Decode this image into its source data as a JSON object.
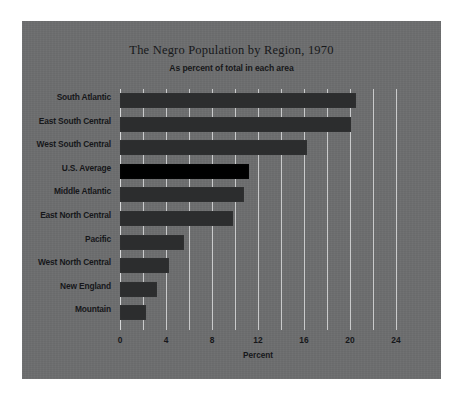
{
  "chart_data": {
    "type": "bar",
    "orientation": "horizontal",
    "title": "The Negro Population by Region, 1970",
    "subtitle": "As percent of total in each area",
    "xlabel": "Percent",
    "ylabel": "",
    "xlim": [
      0,
      24
    ],
    "xticks": [
      0,
      4,
      8,
      12,
      16,
      20,
      24
    ],
    "xtick_labels": [
      "0",
      "4",
      "8",
      "12",
      "16",
      "20",
      "24"
    ],
    "minor_gridlines": [
      0,
      2,
      4,
      6,
      8,
      10,
      12,
      14,
      16,
      18,
      20,
      22,
      24
    ],
    "grid": true,
    "legend": "none",
    "categories": [
      "South Atlantic",
      "East South Central",
      "West South Central",
      "U.S. Average",
      "Middle Atlantic",
      "East North Central",
      "Pacific",
      "West North Central",
      "New England",
      "Mountain"
    ],
    "values": [
      20.5,
      20.1,
      16.3,
      11.2,
      10.8,
      9.8,
      5.6,
      4.3,
      3.2,
      2.3
    ],
    "highlight_category": "U.S. Average",
    "colors": {
      "panel_background": "#6d6e6f",
      "outer_background": "#ffffff",
      "bar": "#2c2d2e",
      "bar_highlight": "#000000",
      "gridline": "#c9cacb",
      "text": "#16171a"
    }
  }
}
